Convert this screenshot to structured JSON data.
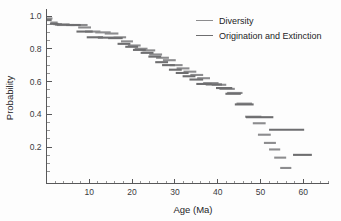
{
  "chart_data": {
    "type": "line",
    "title": "",
    "xlabel": "Age (Ma)",
    "ylabel": "Probability",
    "xlim": [
      0,
      66
    ],
    "ylim": [
      0,
      1.04
    ],
    "grid": false,
    "legend_position": "top-right",
    "xticks": [
      10,
      20,
      30,
      40,
      50,
      60
    ],
    "xtick_labels": [
      "10",
      "20",
      "30",
      "40",
      "50",
      "60"
    ],
    "xtick_minor_step": 2,
    "yticks": [
      0.2,
      0.4,
      0.6,
      0.8,
      1.0
    ],
    "ytick_labels": [
      "0.2",
      "0.4",
      "0.6",
      "0.8",
      "1.0"
    ],
    "ytick_minor_step": 0.05,
    "series": [
      {
        "name": "Diversity",
        "color": "#8c8c8e",
        "style": "step-segments",
        "segments": [
          [
            0.0,
            1.4,
            0.985
          ],
          [
            0.9,
            2.6,
            0.96
          ],
          [
            1.6,
            3.6,
            0.95
          ],
          [
            2.4,
            6.6,
            0.945
          ],
          [
            5.6,
            9.6,
            0.945
          ],
          [
            7.4,
            10.4,
            0.93
          ],
          [
            9.0,
            12.6,
            0.905
          ],
          [
            11.4,
            15.0,
            0.9
          ],
          [
            13.6,
            16.8,
            0.893
          ],
          [
            15.6,
            18.6,
            0.87
          ],
          [
            17.4,
            20.2,
            0.845
          ],
          [
            19.0,
            22.0,
            0.82
          ],
          [
            20.6,
            23.6,
            0.8
          ],
          [
            22.4,
            25.4,
            0.79
          ],
          [
            24.0,
            27.0,
            0.765
          ],
          [
            25.6,
            28.6,
            0.745
          ],
          [
            27.2,
            30.2,
            0.73
          ],
          [
            28.8,
            31.8,
            0.7
          ],
          [
            30.4,
            33.4,
            0.68
          ],
          [
            32.0,
            35.0,
            0.66
          ],
          [
            33.6,
            36.6,
            0.64
          ],
          [
            35.2,
            38.2,
            0.62
          ],
          [
            36.6,
            40.2,
            0.59
          ],
          [
            38.6,
            42.0,
            0.58
          ],
          [
            40.4,
            44.0,
            0.555
          ],
          [
            42.2,
            45.8,
            0.53
          ],
          [
            44.4,
            48.0,
            0.465
          ],
          [
            46.4,
            50.2,
            0.385
          ],
          [
            48.2,
            51.2,
            0.345
          ],
          [
            49.4,
            52.4,
            0.275
          ],
          [
            50.8,
            53.6,
            0.225
          ],
          [
            52.0,
            54.6,
            0.185
          ],
          [
            53.2,
            56.0,
            0.135
          ],
          [
            54.6,
            57.2,
            0.072
          ]
        ]
      },
      {
        "name": "Origination and Extinction",
        "color": "#6e6e70",
        "style": "step-segments",
        "segments": [
          [
            0.0,
            1.2,
            0.975
          ],
          [
            0.8,
            2.8,
            0.952
          ],
          [
            2.0,
            5.4,
            0.948
          ],
          [
            4.6,
            8.0,
            0.945
          ],
          [
            7.0,
            10.8,
            0.905
          ],
          [
            9.4,
            13.2,
            0.87
          ],
          [
            12.0,
            15.6,
            0.868
          ],
          [
            14.4,
            17.8,
            0.865
          ],
          [
            16.6,
            19.6,
            0.83
          ],
          [
            18.4,
            21.4,
            0.812
          ],
          [
            20.2,
            23.2,
            0.793
          ],
          [
            22.0,
            25.0,
            0.775
          ],
          [
            23.8,
            26.8,
            0.752
          ],
          [
            25.4,
            28.4,
            0.718
          ],
          [
            27.0,
            30.0,
            0.7
          ],
          [
            28.6,
            31.6,
            0.672
          ],
          [
            30.2,
            33.2,
            0.652
          ],
          [
            31.8,
            34.8,
            0.632
          ],
          [
            33.4,
            36.6,
            0.612
          ],
          [
            35.0,
            38.6,
            0.585
          ],
          [
            37.2,
            41.0,
            0.582
          ],
          [
            39.6,
            43.4,
            0.56
          ],
          [
            41.8,
            45.4,
            0.525
          ],
          [
            44.0,
            48.4,
            0.46
          ],
          [
            46.6,
            53.0,
            0.382
          ],
          [
            52.0,
            60.2,
            0.305
          ],
          [
            57.6,
            62.0,
            0.152
          ]
        ]
      }
    ]
  },
  "legend": {
    "items": [
      {
        "label": "Diversity",
        "color": "#8c8c8e"
      },
      {
        "label": "Origination and Extinction",
        "color": "#6e6e70"
      }
    ]
  },
  "axes": {
    "x_title": "Age (Ma)",
    "y_title": "Probability"
  }
}
